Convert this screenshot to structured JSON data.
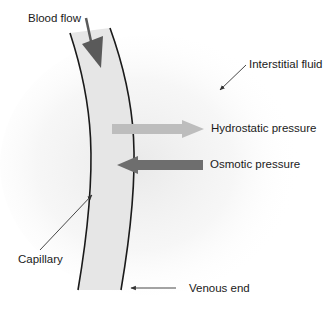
{
  "diagram": {
    "labels": {
      "blood_flow": "Blood flow",
      "interstitial_fluid": "Interstitial fluid",
      "hydrostatic_pressure": "Hydrostatic pressure",
      "osmotic_pressure": "Osmotic pressure",
      "capillary": "Capillary",
      "venous_end": "Venous end"
    },
    "colors": {
      "capillary_fill": "#e6e6e6",
      "wall": "#1a1a1a",
      "blood_flow_arrow": "#5a5a5a",
      "hydrostatic_arrow": "#bdbdbd",
      "osmotic_arrow": "#6e6e6e",
      "haze": "#ededed",
      "pointer": "#333333"
    },
    "arrows": {
      "hydrostatic_direction": "outward (right)",
      "osmotic_direction": "inward (left)",
      "blood_flow_direction": "down"
    }
  }
}
